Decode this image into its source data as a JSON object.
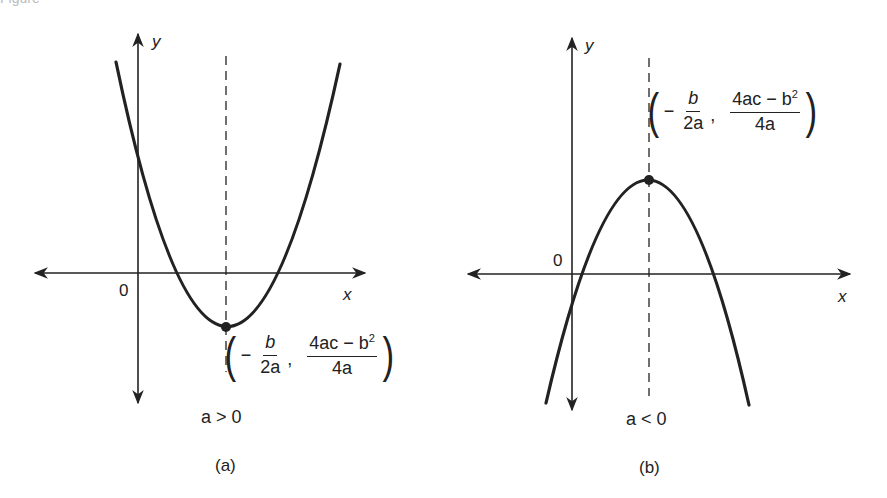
{
  "header": {
    "cropped_text": "Figure"
  },
  "panels": [
    {
      "id": "a",
      "caption": "(a)",
      "condition": "a > 0",
      "origin_label": "0",
      "x_axis_label": "x",
      "y_axis_label": "y",
      "vertex": {
        "x_num": "b",
        "x_den": "2a",
        "x_sign": "−",
        "y_num": "4ac − b",
        "y_num_exp": "2",
        "y_den": "4a",
        "open": "(",
        "close": ")",
        "sep": ","
      },
      "opens": "upward"
    },
    {
      "id": "b",
      "caption": "(b)",
      "condition": "a < 0",
      "origin_label": "0",
      "x_axis_label": "x",
      "y_axis_label": "y",
      "vertex": {
        "x_num": "b",
        "x_den": "2a",
        "x_sign": "−",
        "y_num": "4ac − b",
        "y_num_exp": "2",
        "y_den": "4a",
        "open": "(",
        "close": ")",
        "sep": ","
      },
      "opens": "downward"
    }
  ],
  "colors": {
    "stroke": "#222222",
    "background": "#ffffff"
  }
}
